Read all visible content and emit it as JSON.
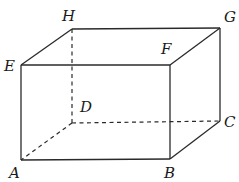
{
  "diagram": {
    "type": "rectangular-prism",
    "vertices": {
      "A": {
        "label": "A",
        "x": 21,
        "y": 160,
        "lx": 9,
        "ly": 178
      },
      "B": {
        "label": "B",
        "x": 170,
        "y": 159,
        "lx": 164,
        "ly": 178
      },
      "C": {
        "label": "C",
        "x": 220,
        "y": 121,
        "lx": 224,
        "ly": 127
      },
      "D": {
        "label": "D",
        "x": 72,
        "y": 123,
        "lx": 80,
        "ly": 112
      },
      "E": {
        "label": "E",
        "x": 21,
        "y": 65,
        "lx": 4,
        "ly": 71
      },
      "F": {
        "label": "F",
        "x": 170,
        "y": 65,
        "lx": 161,
        "ly": 54
      },
      "G": {
        "label": "G",
        "x": 220,
        "y": 28,
        "lx": 224,
        "ly": 22
      },
      "H": {
        "label": "H",
        "x": 72,
        "y": 29,
        "lx": 62,
        "ly": 21
      }
    },
    "visible_edges": [
      [
        "A",
        "B"
      ],
      [
        "B",
        "C"
      ],
      [
        "C",
        "G"
      ],
      [
        "G",
        "H"
      ],
      [
        "H",
        "E"
      ],
      [
        "E",
        "A"
      ],
      [
        "E",
        "F"
      ],
      [
        "F",
        "G"
      ],
      [
        "F",
        "B"
      ]
    ],
    "hidden_edges": [
      [
        "D",
        "A"
      ],
      [
        "D",
        "C"
      ],
      [
        "D",
        "H"
      ]
    ],
    "colors": {
      "edge": "#2a2a2a",
      "label": "#1a1a1a",
      "background": "#ffffff"
    }
  }
}
